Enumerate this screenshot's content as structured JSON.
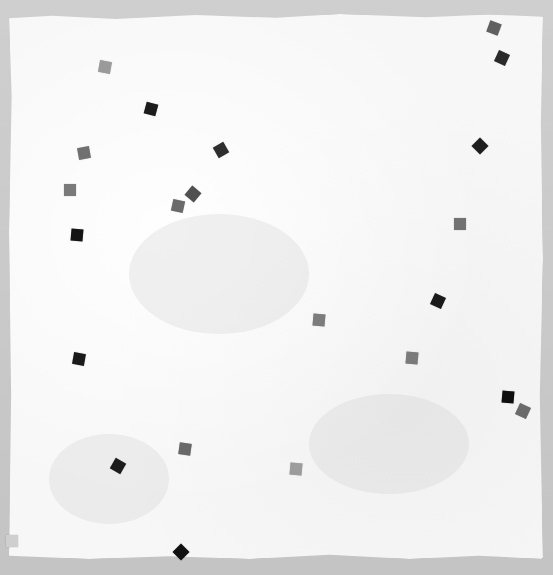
{
  "scene": {
    "description": "Scanned sheet of white handmade paper with deckled edges on a gray background, scattered with small gray and black square confetti pieces",
    "background_color": "#c9c9c9",
    "paper_color": "#f7f7f7"
  },
  "squares": [
    {
      "x": 105,
      "y": 67,
      "color": "#9a9a9a",
      "rotate": 10
    },
    {
      "x": 151,
      "y": 109,
      "color": "#1c1c1c",
      "rotate": 15
    },
    {
      "x": 84,
      "y": 153,
      "color": "#707070",
      "rotate": -10
    },
    {
      "x": 221,
      "y": 150,
      "color": "#2e2e2e",
      "rotate": -30
    },
    {
      "x": 70,
      "y": 190,
      "color": "#7a7a7a",
      "rotate": 0
    },
    {
      "x": 193,
      "y": 194,
      "color": "#505050",
      "rotate": 40
    },
    {
      "x": 178,
      "y": 206,
      "color": "#6a6a6a",
      "rotate": 12
    },
    {
      "x": 77,
      "y": 235,
      "color": "#141414",
      "rotate": 5
    },
    {
      "x": 494,
      "y": 28,
      "color": "#606060",
      "rotate": 20
    },
    {
      "x": 502,
      "y": 58,
      "color": "#2a2a2a",
      "rotate": 25
    },
    {
      "x": 480,
      "y": 146,
      "color": "#1e1e1e",
      "rotate": 45
    },
    {
      "x": 460,
      "y": 224,
      "color": "#727272",
      "rotate": 0
    },
    {
      "x": 438,
      "y": 301,
      "color": "#1a1a1a",
      "rotate": 25
    },
    {
      "x": 319,
      "y": 320,
      "color": "#7c7c7c",
      "rotate": 5
    },
    {
      "x": 79,
      "y": 359,
      "color": "#1a1a1a",
      "rotate": 10
    },
    {
      "x": 412,
      "y": 358,
      "color": "#7a7a7a",
      "rotate": 5
    },
    {
      "x": 508,
      "y": 397,
      "color": "#0e0e0e",
      "rotate": 5
    },
    {
      "x": 523,
      "y": 411,
      "color": "#6a6a6a",
      "rotate": 25
    },
    {
      "x": 185,
      "y": 449,
      "color": "#686868",
      "rotate": 8
    },
    {
      "x": 118,
      "y": 466,
      "color": "#1c1c1c",
      "rotate": 30
    },
    {
      "x": 296,
      "y": 469,
      "color": "#9c9c9c",
      "rotate": 5
    },
    {
      "x": 181,
      "y": 552,
      "color": "#111111",
      "rotate": 45
    },
    {
      "x": 12,
      "y": 541,
      "color": "#cfcfcf",
      "rotate": 0
    }
  ]
}
